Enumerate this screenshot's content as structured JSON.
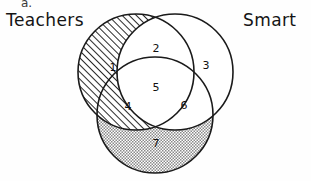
{
  "diagram": {
    "type": "venn",
    "title": "",
    "stray_mark": "a.",
    "set_labels": [
      {
        "id": "teachers",
        "text": "Teachers",
        "position": "top-left"
      },
      {
        "id": "smart",
        "text": "Smart",
        "position": "top-right"
      }
    ],
    "circles": [
      {
        "id": "teachers-circle",
        "cx": 136,
        "cy": 72,
        "r": 58,
        "fill": "diagonal-hatch",
        "stroke": "#1a1a1a"
      },
      {
        "id": "smart-circle",
        "cx": 175,
        "cy": 72,
        "r": 58,
        "fill": "none",
        "stroke": "#1a1a1a"
      },
      {
        "id": "third-circle",
        "cx": 155,
        "cy": 115,
        "r": 58,
        "fill": "dot-stipple",
        "stroke": "#1a1a1a"
      }
    ],
    "regions": [
      {
        "number": "1",
        "x": 113,
        "y": 67,
        "fill": "diagonal-hatch"
      },
      {
        "number": "2",
        "x": 156,
        "y": 48,
        "fill": "none"
      },
      {
        "number": "3",
        "x": 206,
        "y": 65,
        "fill": "none"
      },
      {
        "number": "4",
        "x": 128,
        "y": 106,
        "fill": "diagonal-hatch-and-dots"
      },
      {
        "number": "5",
        "x": 156,
        "y": 87,
        "fill": "none"
      },
      {
        "number": "6",
        "x": 184,
        "y": 105,
        "fill": "none"
      },
      {
        "number": "7",
        "x": 156,
        "y": 143,
        "fill": "dot-stipple"
      }
    ],
    "colors": {
      "stroke": "#1a1a1a",
      "text": "#111111",
      "background": "#fefefe",
      "hatch": "#2a2a2a",
      "stipple": "#555555"
    }
  }
}
